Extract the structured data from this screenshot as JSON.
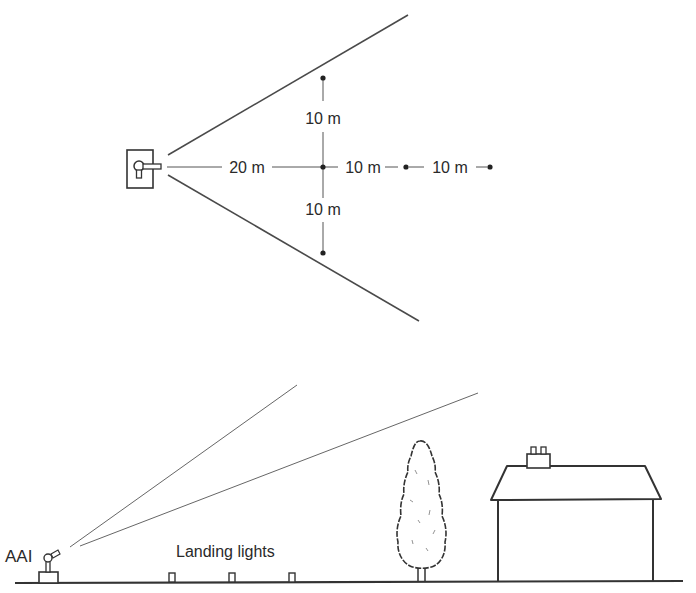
{
  "top_view": {
    "labels": {
      "near_distance": "20 m",
      "upper_offset": "10 m",
      "lower_offset": "10 m",
      "far_step_1": "10 m",
      "far_step_2": "10 m"
    }
  },
  "side_view": {
    "labels": {
      "device": "AAI",
      "landing_lights": "Landing lights"
    }
  },
  "colors": {
    "line": "#3a3a3a",
    "background": "#ffffff"
  }
}
